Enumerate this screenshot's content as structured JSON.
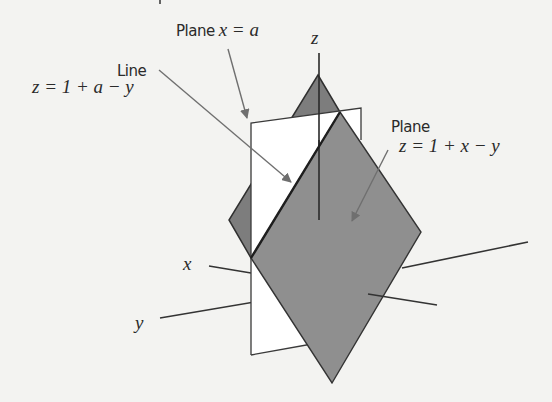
{
  "diagram": {
    "type": "3d-geometry",
    "labels": {
      "plane_xa": "Plane x = a",
      "plane_xa_name": "Plane",
      "plane_xa_eq": "x = a",
      "line_name": "Line",
      "line_eq": "z = 1 + a − y",
      "plane_name": "Plane",
      "plane_eq": "z = 1 + x − y",
      "axis_x": "x",
      "axis_y": "y",
      "axis_z": "z"
    },
    "colors": {
      "background": "#f3f3f1",
      "plane_fill": "#8e8e8e",
      "plane_fill_back": "#7b7b7b",
      "vertical_plane_fill": "#ffffff",
      "stroke": "#2f2f2f",
      "arrow": "#6f6f6f"
    }
  }
}
